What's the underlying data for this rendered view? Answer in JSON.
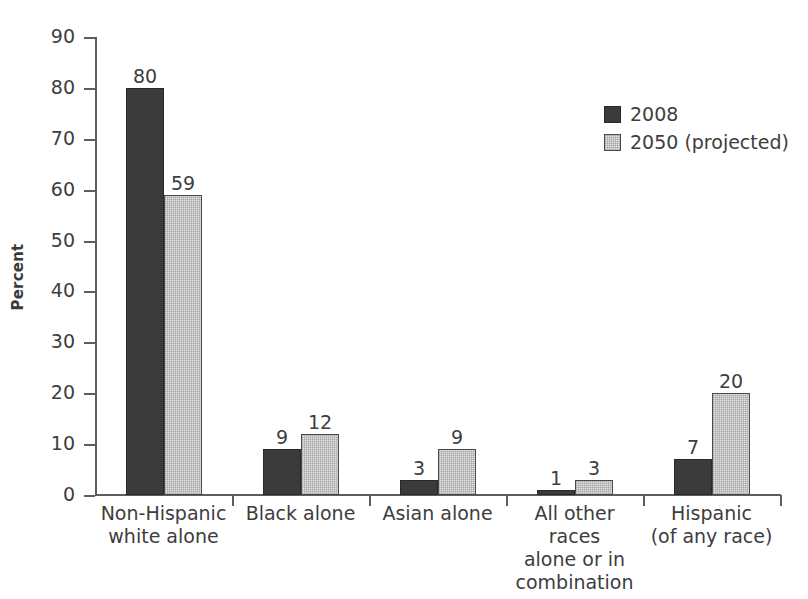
{
  "chart_data": {
    "type": "bar",
    "title": "",
    "subtitle": "",
    "xlabel": "",
    "ylabel": "Percent",
    "ylim": [
      0,
      90
    ],
    "ytick_step": 10,
    "yticks": [
      0,
      10,
      20,
      30,
      40,
      50,
      60,
      70,
      80,
      90
    ],
    "ytick_labels": [
      "0",
      "10",
      "20",
      "30",
      "40",
      "50",
      "60",
      "70",
      "80",
      "90"
    ],
    "grid": false,
    "legend_position": "upper-right",
    "value_labels_shown": true,
    "categories": [
      "Non-Hispanic\nwhite alone",
      "Black alone",
      "Asian alone",
      "All other races\nalone or in\ncombination",
      "Hispanic\n(of any race)"
    ],
    "series": [
      {
        "name": "2008",
        "color": "#3b3b3b",
        "values": [
          80,
          9,
          3,
          1,
          7
        ]
      },
      {
        "name": "2050 (projected)",
        "color": "#e2e2e2",
        "values": [
          59,
          12,
          9,
          3,
          20
        ]
      }
    ]
  },
  "legend": {
    "items": [
      {
        "label": "2008",
        "swatch": "dark-swatch"
      },
      {
        "label": "2050 (projected)",
        "swatch": "light-swatch"
      }
    ]
  },
  "colors": {
    "series_2008": "#3b3b3b",
    "series_2050": "#e2e2e2",
    "axis": "#5d5d5d",
    "text": "#3d3d3d",
    "background": "#ffffff"
  },
  "caption_strip": {
    "text": ""
  }
}
